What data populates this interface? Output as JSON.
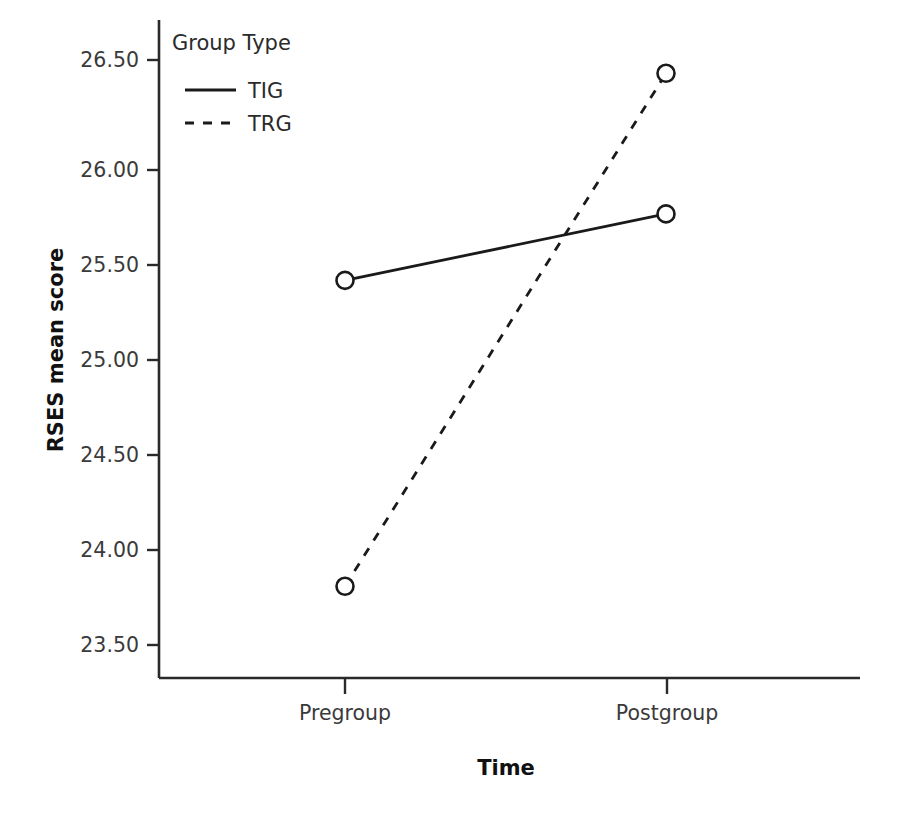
{
  "chart_data": {
    "type": "line",
    "title": "",
    "subtitle": "",
    "xlabel": "Time",
    "ylabel": "RSES mean score",
    "categories": [
      "Pregroup",
      "Postgroup"
    ],
    "xtick_labels": [
      "Pregroup",
      "Postgroup"
    ],
    "ytick_labels": [
      "23.50",
      "24.00",
      "24.50",
      "25.00",
      "25.50",
      "26.00",
      "26.50"
    ],
    "yticks": [
      23.5,
      24.0,
      24.5,
      25.0,
      25.5,
      26.0,
      26.5
    ],
    "ylim": [
      23.35,
      26.62
    ],
    "xlim": [
      0,
      1
    ],
    "grid": false,
    "legend_title": "Group Type",
    "legend_position": "inside-top-left",
    "series": [
      {
        "name": "TIG",
        "style": "solid",
        "marker": "open-circle",
        "color": "#1a1a1a",
        "values": [
          25.34,
          25.69
        ]
      },
      {
        "name": "TRG",
        "style": "dashed",
        "marker": "open-circle",
        "color": "#1a1a1a",
        "values": [
          23.73,
          26.43
        ]
      }
    ],
    "annotations": []
  },
  "axes": {
    "y_axis_label": "RSES mean score",
    "x_axis_label": "Time",
    "y_tick_0": "23.50",
    "y_tick_1": "24.00",
    "y_tick_2": "24.50",
    "y_tick_3": "25.00",
    "y_tick_4": "25.50",
    "y_tick_5": "26.00",
    "y_tick_6": "26.50",
    "x_tick_0": "Pregroup",
    "x_tick_1": "Postgroup"
  },
  "legend": {
    "title": "Group Type",
    "entry_0_label": "TIG",
    "entry_1_label": "TRG"
  },
  "colors": {
    "line": "#1a1a1a",
    "axis": "#2a2a2a",
    "text": "#2b2b2b",
    "title_text": "#111111",
    "background": "#ffffff"
  }
}
